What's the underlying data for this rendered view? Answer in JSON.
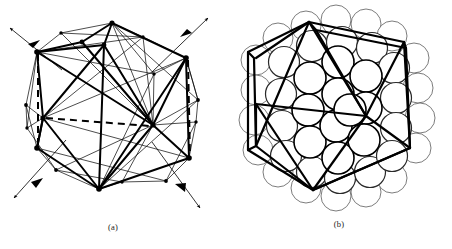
{
  "figure": {
    "background_color": "#ffffff",
    "ink_color": "#000000",
    "width": 452,
    "height": 249
  },
  "panels": [
    {
      "id": "a",
      "caption": "(a)",
      "description": "Wireframe icosahedron with twofold symmetry axes and hidden edges dashed",
      "center": {
        "x": 110,
        "y": 110
      },
      "bold_stroke_color": "#000000",
      "thin_stroke_color": "#000000",
      "dashed_stroke_color": "#000000",
      "vertex_marker_color": "#000000",
      "bold_stroke_width": 2.0,
      "thin_stroke_width": 0.7,
      "dashed_stroke_width": 2.0,
      "vertex_radius": 2.4,
      "axis_count": 4,
      "axis_label": "twofold axis",
      "bold_vertices": [
        {
          "name": "top",
          "x": 112,
          "y": 23
        },
        {
          "name": "upper-left",
          "x": 37,
          "y": 52
        },
        {
          "name": "upper-right",
          "x": 186,
          "y": 58
        },
        {
          "name": "upper-mid",
          "x": 82,
          "y": 42
        },
        {
          "name": "center-left",
          "x": 43,
          "y": 118
        },
        {
          "name": "center-right",
          "x": 153,
          "y": 125
        },
        {
          "name": "lower-left",
          "x": 37,
          "y": 148
        },
        {
          "name": "lower-right",
          "x": 189,
          "y": 158
        },
        {
          "name": "bottom",
          "x": 99,
          "y": 189
        },
        {
          "name": "inner-apex",
          "x": 104,
          "y": 45
        }
      ],
      "thin_vertices": [
        {
          "x": 26,
          "y": 105
        },
        {
          "x": 27,
          "y": 128
        },
        {
          "x": 56,
          "y": 170
        },
        {
          "x": 143,
          "y": 37
        },
        {
          "x": 198,
          "y": 100
        },
        {
          "x": 196,
          "y": 122
        },
        {
          "x": 166,
          "y": 181
        },
        {
          "x": 61,
          "y": 33
        },
        {
          "x": 122,
          "y": 182
        },
        {
          "x": 154,
          "y": 74
        }
      ],
      "dashed_edges": [
        {
          "name": "horizontal-hidden-edge",
          "x1": 46,
          "y1": 118,
          "x2": 150,
          "y2": 126
        },
        {
          "name": "left-vertical-hidden-edge",
          "x1": 38,
          "y1": 54,
          "x2": 38,
          "y2": 146
        },
        {
          "name": "right-vertical-hidden-edge",
          "x1": 188,
          "y1": 60,
          "x2": 190,
          "y2": 156
        }
      ],
      "axes": [
        {
          "name": "axis-upper-left",
          "x1": 62,
          "y1": 70,
          "x2": 10,
          "y2": 28
        },
        {
          "name": "axis-upper-right",
          "x1": 152,
          "y1": 72,
          "x2": 208,
          "y2": 18
        },
        {
          "name": "axis-lower-left",
          "x1": 66,
          "y1": 140,
          "x2": 14,
          "y2": 198
        },
        {
          "name": "axis-lower-right",
          "x1": 152,
          "y1": 142,
          "x2": 200,
          "y2": 208
        }
      ]
    },
    {
      "id": "b",
      "caption": "(b)",
      "description": "Same cluster drawn as close-packed hard spheres with icosahedral wireframe overlaid",
      "center": {
        "x": 113,
        "y": 112
      },
      "sphere_fill": "#ffffff",
      "sphere_outline_inner": "#000000",
      "sphere_outline_outer": "#5a5a5a",
      "sphere_radius": 15.5,
      "sphere_stroke_inner": 1.5,
      "sphere_stroke_outer": 0.8,
      "wire_stroke_color": "#000000",
      "wire_stroke_width": 2.2,
      "sphere_count": 55,
      "hex_outline": [
        {
          "x": 83,
          "y": 22
        },
        {
          "x": 178,
          "y": 42
        },
        {
          "x": 184,
          "y": 148
        },
        {
          "x": 87,
          "y": 190
        },
        {
          "x": 22,
          "y": 150
        },
        {
          "x": 22,
          "y": 52
        }
      ]
    }
  ]
}
